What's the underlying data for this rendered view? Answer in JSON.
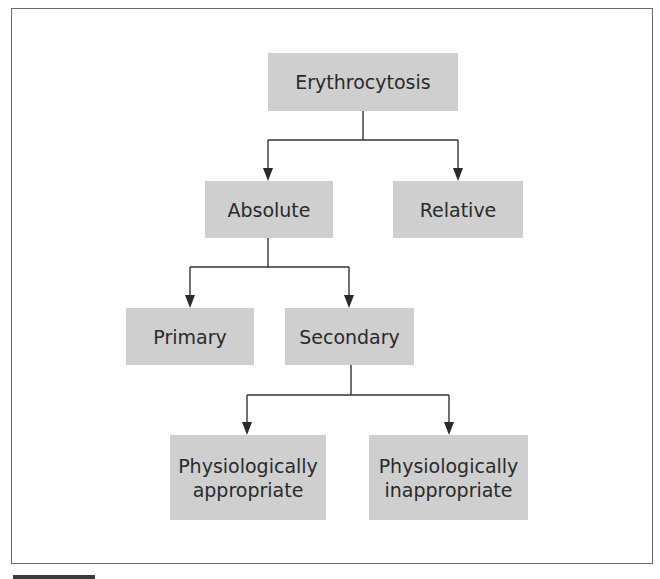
{
  "diagram": {
    "root": {
      "label": "Erythrocytosis"
    },
    "level1": [
      {
        "label": "Absolute"
      },
      {
        "label": "Relative"
      }
    ],
    "level2": [
      {
        "label": "Primary"
      },
      {
        "label": "Secondary"
      }
    ],
    "level3": [
      {
        "label_line1": "Physiologically",
        "label_line2": "appropriate"
      },
      {
        "label_line1": "Physiologically",
        "label_line2": "inappropriate"
      }
    ],
    "edges": [
      {
        "from": "Erythrocytosis",
        "to": "Absolute"
      },
      {
        "from": "Erythrocytosis",
        "to": "Relative"
      },
      {
        "from": "Absolute",
        "to": "Primary"
      },
      {
        "from": "Absolute",
        "to": "Secondary"
      },
      {
        "from": "Secondary",
        "to": "Physiologically appropriate"
      },
      {
        "from": "Secondary",
        "to": "Physiologically inappropriate"
      }
    ],
    "colors": {
      "node_fill": "#cfcfcf",
      "text": "#2a2a2a",
      "line": "#333333",
      "frame": "#6a6a6a"
    }
  }
}
